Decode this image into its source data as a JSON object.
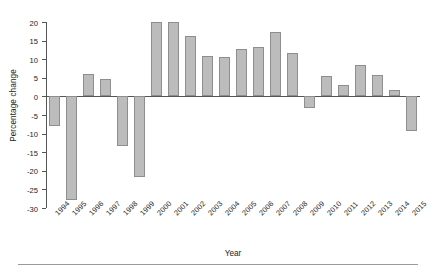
{
  "chart_data": {
    "type": "bar",
    "title": "",
    "subtitle": "",
    "xlabel": "Year",
    "ylabel": "Percentage change",
    "categories": [
      "1994",
      "1995",
      "1996",
      "1997",
      "1998",
      "1999",
      "2000",
      "2001",
      "2002",
      "2003",
      "2004",
      "2005",
      "2006",
      "2007",
      "2008",
      "2009",
      "2010",
      "2011",
      "2012",
      "2013",
      "2014",
      "2015"
    ],
    "values": [
      -8.0,
      -27.8,
      6.0,
      4.8,
      -13.4,
      -21.8,
      20.1,
      20.1,
      16.3,
      10.9,
      10.6,
      12.8,
      13.4,
      17.4,
      11.6,
      -3.2,
      5.4,
      3.1,
      8.5,
      5.7,
      1.6,
      -9.3
    ],
    "series": [
      {
        "name": "Percentage change",
        "values": [
          -8.0,
          -27.8,
          6.0,
          4.8,
          -13.4,
          -21.8,
          20.1,
          20.1,
          16.3,
          10.9,
          10.6,
          12.8,
          13.4,
          17.4,
          11.6,
          -3.2,
          5.4,
          3.1,
          8.5,
          5.7,
          1.6,
          -9.3
        ]
      }
    ],
    "ylim": [
      -30,
      20
    ],
    "ytick_labels": [
      "20",
      "15",
      "10",
      "5",
      "0",
      "-5",
      "-10",
      "-15",
      "-20",
      "-25",
      "-30"
    ],
    "ytick_values": [
      20,
      15,
      10,
      5,
      0,
      -5,
      -10,
      -15,
      -20,
      -25,
      -30
    ],
    "grid": false,
    "legend": null,
    "legend_position": "none",
    "bar_color": "#bcbcbc",
    "bar_edge_color": "#8e8e8e",
    "axis_color": "#555555",
    "text_color": "#1c1c1c",
    "xtick_rotation": -45,
    "annotations": []
  },
  "figure": {
    "background": "#ffffff",
    "bottom_rule_color": "#9a9a9a"
  }
}
